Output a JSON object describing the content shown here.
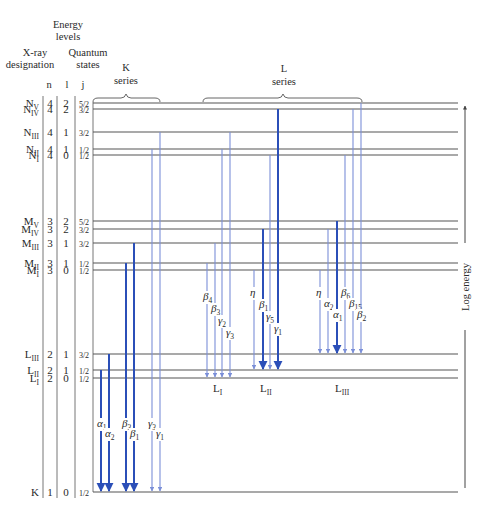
{
  "header": {
    "energy_levels": [
      "Energy",
      "levels"
    ],
    "xray_designation": [
      "X-ray",
      "designation"
    ],
    "quantum_states": [
      "Quantum",
      "states"
    ],
    "col_n": "n",
    "col_l": "l",
    "col_j": "j"
  },
  "series": {
    "k": [
      "K",
      "series"
    ],
    "l": [
      "L",
      "series"
    ]
  },
  "axis_label": "Log energy",
  "colors": {
    "strong": "#2b4fb8",
    "weak": "#7b8fd8",
    "level": "#555555"
  },
  "levels": [
    {
      "id": "NV",
      "base": "N",
      "sub": "V",
      "n": "4",
      "l": "2",
      "j": "5/2"
    },
    {
      "id": "NIV",
      "base": "N",
      "sub": "IV",
      "n": "4",
      "l": "2",
      "j": "3/2"
    },
    {
      "id": "NIII",
      "base": "N",
      "sub": "III",
      "n": "4",
      "l": "1",
      "j": "3/2"
    },
    {
      "id": "NII",
      "base": "N",
      "sub": "II",
      "n": "4",
      "l": "1",
      "j": "1/2"
    },
    {
      "id": "NI",
      "base": "N",
      "sub": "I",
      "n": "4",
      "l": "0",
      "j": "1/2"
    },
    {
      "id": "MV",
      "base": "M",
      "sub": "V",
      "n": "3",
      "l": "2",
      "j": "5/2"
    },
    {
      "id": "MIV",
      "base": "M",
      "sub": "IV",
      "n": "3",
      "l": "2",
      "j": "3/2"
    },
    {
      "id": "MIII",
      "base": "M",
      "sub": "III",
      "n": "3",
      "l": "1",
      "j": "3/2"
    },
    {
      "id": "MII",
      "base": "M",
      "sub": "II",
      "n": "3",
      "l": "1",
      "j": "1/2"
    },
    {
      "id": "MI",
      "base": "M",
      "sub": "I",
      "n": "3",
      "l": "0",
      "j": "1/2"
    },
    {
      "id": "LIII",
      "base": "L",
      "sub": "III",
      "n": "2",
      "l": "1",
      "j": "3/2"
    },
    {
      "id": "LII",
      "base": "L",
      "sub": "II",
      "n": "2",
      "l": "1",
      "j": "1/2"
    },
    {
      "id": "LI",
      "base": "L",
      "sub": "I",
      "n": "2",
      "l": "0",
      "j": "1/2"
    },
    {
      "id": "K",
      "base": "K",
      "sub": "",
      "n": "1",
      "l": "0",
      "j": "1/2"
    }
  ],
  "target_labels": [
    {
      "target": "LI",
      "base": "L",
      "sub": "I"
    },
    {
      "target": "LII",
      "base": "L",
      "sub": "II"
    },
    {
      "target": "LIII",
      "base": "L",
      "sub": "III"
    }
  ],
  "transitions": [
    {
      "series": "K",
      "greek": "α",
      "sub": "1",
      "from": "LII",
      "to": "K",
      "strength": "strong"
    },
    {
      "series": "K",
      "greek": "α",
      "sub": "2",
      "from": "LIII",
      "to": "K",
      "strength": "strong"
    },
    {
      "series": "K",
      "greek": "β",
      "sub": "3",
      "from": "MII",
      "to": "K",
      "strength": "strong"
    },
    {
      "series": "K",
      "greek": "β",
      "sub": "1",
      "from": "MIII",
      "to": "K",
      "strength": "strong"
    },
    {
      "series": "K",
      "greek": "γ",
      "sub": "3",
      "from": "NII",
      "to": "K",
      "strength": "weak"
    },
    {
      "series": "K",
      "greek": "γ",
      "sub": "1",
      "from": "NIII",
      "to": "K",
      "strength": "weak"
    },
    {
      "series": "L",
      "greek": "β",
      "sub": "4",
      "from": "MII",
      "to": "LI",
      "strength": "weak"
    },
    {
      "series": "L",
      "greek": "β",
      "sub": "3",
      "from": "MIII",
      "to": "LI",
      "strength": "weak"
    },
    {
      "series": "L",
      "greek": "γ",
      "sub": "2",
      "from": "NII",
      "to": "LI",
      "strength": "weak"
    },
    {
      "series": "L",
      "greek": "γ",
      "sub": "3",
      "from": "NIII",
      "to": "LI",
      "strength": "weak"
    },
    {
      "series": "L",
      "greek": "η",
      "sub": "",
      "from": "MI",
      "to": "LII",
      "strength": "weak"
    },
    {
      "series": "L",
      "greek": "β",
      "sub": "1",
      "from": "MIV",
      "to": "LII",
      "strength": "strong"
    },
    {
      "series": "L",
      "greek": "γ",
      "sub": "5",
      "from": "NI",
      "to": "LII",
      "strength": "weak"
    },
    {
      "series": "L",
      "greek": "γ",
      "sub": "1",
      "from": "NIV",
      "to": "LII",
      "strength": "strong"
    },
    {
      "series": "L",
      "greek": "η",
      "sub": "",
      "from": "MI",
      "to": "LIII",
      "strength": "weak"
    },
    {
      "series": "L",
      "greek": "α",
      "sub": "2",
      "from": "MIV",
      "to": "LIII",
      "strength": "weak"
    },
    {
      "series": "L",
      "greek": "α",
      "sub": "1",
      "from": "MV",
      "to": "LIII",
      "strength": "strong"
    },
    {
      "series": "L",
      "greek": "β",
      "sub": "6",
      "from": "NI",
      "to": "LIII",
      "strength": "weak"
    },
    {
      "series": "L",
      "greek": "β",
      "sub": "15",
      "from": "NIV",
      "to": "LIII",
      "strength": "weak"
    },
    {
      "series": "L",
      "greek": "β",
      "sub": "2",
      "from": "NV",
      "to": "LIII",
      "strength": "weak"
    }
  ]
}
